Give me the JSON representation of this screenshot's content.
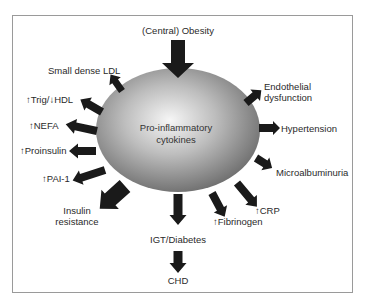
{
  "diagram": {
    "center": {
      "line1": "Pro-inflammatory",
      "line2": "cytokines",
      "fill_light": "#f4f4f4",
      "fill_dark": "#6e6e6e"
    },
    "input": {
      "label": "(Central) Obesity"
    },
    "outputs": {
      "small_dense_ldl": "Small dense LDL",
      "trig_hdl": "↑Trig/↓HDL",
      "nefa": "↑NEFA",
      "proinsulin": "↑Proinsulin",
      "pai1": "↑PAI-1",
      "insulin_resistance_1": "Insulin",
      "insulin_resistance_2": "resistance",
      "igt_diabetes": "IGT/Diabetes",
      "chd": "CHD",
      "fibrinogen": "↑Fibrinogen",
      "crp": "↑CRP",
      "microalbuminuria": "Microalbuminuria",
      "hypertension": "Hypertension",
      "endothelial_1": "Endothelial",
      "endothelial_2": "dysfunction"
    },
    "colors": {
      "arrow": "#1a1a1a",
      "text": "#2a2a2a",
      "frame": "#9a9a9a"
    }
  }
}
